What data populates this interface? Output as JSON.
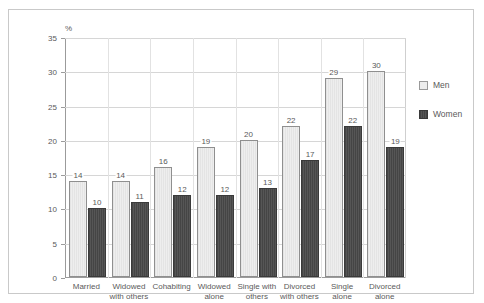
{
  "chart_data": {
    "type": "bar",
    "title": "",
    "xlabel": "",
    "ylabel": "%",
    "ylim": [
      0,
      35
    ],
    "yticks": [
      0,
      5,
      10,
      15,
      20,
      25,
      30,
      35
    ],
    "grid": true,
    "legend_position": "right",
    "categories": [
      "Married",
      "Widowed\nwith others",
      "Cohabiting",
      "Widowed\nalone",
      "Single with\nothers",
      "Divorced\nwith others",
      "Single\nalone",
      "Divorced\nalone"
    ],
    "series": [
      {
        "name": "Men",
        "color": "#ededed",
        "values": [
          14,
          14,
          16,
          19,
          20,
          22,
          29,
          30
        ]
      },
      {
        "name": "Women",
        "color": "#4d4d4d",
        "values": [
          10,
          11,
          12,
          12,
          13,
          17,
          22,
          19
        ]
      }
    ]
  },
  "legend": {
    "items": [
      {
        "label": "Men"
      },
      {
        "label": "Women"
      }
    ]
  },
  "axis": {
    "unit_label": "%",
    "tick_labels": [
      "35",
      "30",
      "25",
      "20",
      "15",
      "10",
      "5",
      "0"
    ]
  }
}
